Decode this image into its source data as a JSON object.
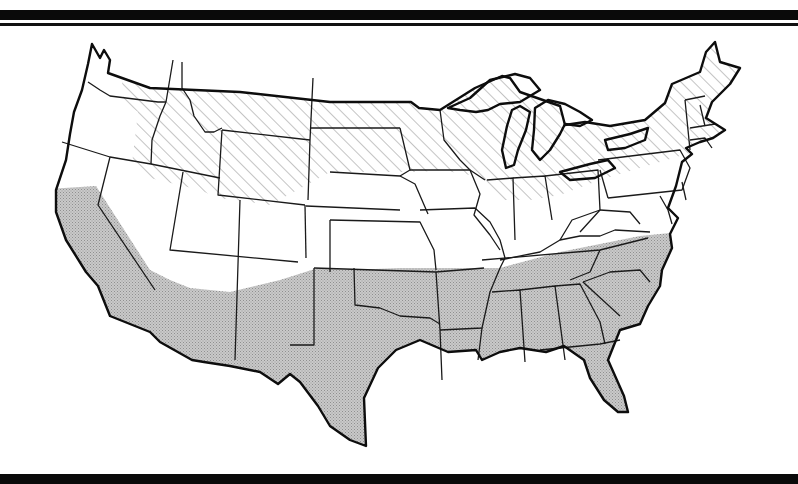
{
  "figure": {
    "zones": [
      {
        "id": "north",
        "pattern": "diagonal-hatch",
        "color": "#8a8a8a",
        "states": [
          "Washington (east)",
          "Oregon (east edge)",
          "Idaho",
          "Montana",
          "Wyoming",
          "North Dakota",
          "South Dakota",
          "Minnesota",
          "Wisconsin",
          "Michigan",
          "Iowa (north)",
          "Illinois (north)",
          "Indiana (north)",
          "Ohio (north)",
          "New York",
          "Pennsylvania (north)",
          "Vermont",
          "New Hampshire",
          "Maine",
          "Massachusetts",
          "Connecticut",
          "Rhode Island"
        ]
      },
      {
        "id": "south",
        "pattern": "gray-stipple",
        "color": "#bdbdbd",
        "states": [
          "California (south/central)",
          "Arizona (south)",
          "New Mexico (south)",
          "Texas",
          "Oklahoma",
          "Arkansas",
          "Louisiana",
          "Mississippi",
          "Alabama",
          "Georgia",
          "Florida",
          "South Carolina",
          "North Carolina",
          "Tennessee"
        ]
      },
      {
        "id": "middle",
        "pattern": "none",
        "color": "#ffffff",
        "states": [
          "Nevada",
          "Utah",
          "Colorado",
          "Kansas",
          "Nebraska",
          "Missouri",
          "Kentucky",
          "West Virginia",
          "Virginia",
          "Maryland",
          "Delaware",
          "New Jersey"
        ]
      }
    ],
    "colors": {
      "outline": "#111111",
      "hatch": "#8a8a8a",
      "stipple": "#bdbdbd",
      "background": "#ffffff",
      "rules": "#0a0a0a"
    }
  }
}
